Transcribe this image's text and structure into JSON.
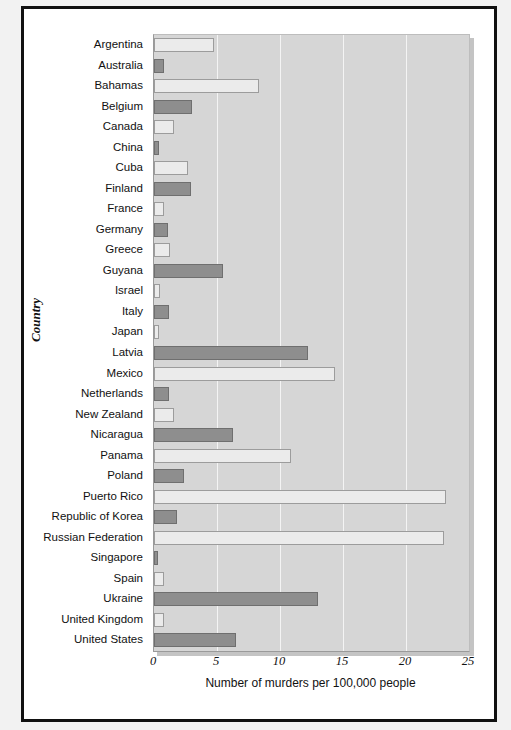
{
  "chart_data": {
    "type": "bar",
    "orientation": "horizontal",
    "title": "",
    "xlabel": "Number of murders per 100,000 people",
    "ylabel": "Country",
    "xlim": [
      0,
      25
    ],
    "xticks": [
      0,
      5,
      10,
      15,
      20,
      25
    ],
    "grid": "vertical",
    "legend": "none",
    "categories": [
      "Argentina",
      "Australia",
      "Bahamas",
      "Belgium",
      "Canada",
      "China",
      "Cuba",
      "Finland",
      "France",
      "Germany",
      "Greece",
      "Guyana",
      "Israel",
      "Italy",
      "Japan",
      "Latvia",
      "Mexico",
      "Netherlands",
      "New Zealand",
      "Nicaragua",
      "Panama",
      "Poland",
      "Puerto Rico",
      "Republic of Korea",
      "Russian Federation",
      "Singapore",
      "Spain",
      "Ukraine",
      "United Kingdom",
      "United States"
    ],
    "values": [
      4.8,
      0.8,
      8.3,
      3.0,
      1.6,
      0.4,
      2.7,
      2.9,
      0.8,
      1.1,
      1.3,
      5.5,
      0.5,
      1.2,
      0.4,
      12.2,
      14.4,
      1.2,
      1.6,
      6.3,
      10.9,
      2.4,
      23.2,
      1.8,
      23.0,
      0.3,
      0.8,
      13.0,
      0.8,
      6.5
    ],
    "bar_styles": [
      "light",
      "dark",
      "light",
      "dark",
      "light",
      "dark",
      "light",
      "dark",
      "light",
      "dark",
      "light",
      "dark",
      "light",
      "dark",
      "light",
      "dark",
      "light",
      "dark",
      "light",
      "dark",
      "light",
      "dark",
      "light",
      "dark",
      "light",
      "dark",
      "light",
      "dark",
      "light",
      "dark"
    ],
    "colors": {
      "light_bar": "#ebebeb",
      "dark_bar": "#8e8e8e",
      "plot_background": "#d6d6d6",
      "gridline": "#f4f4f4",
      "bar_shadow": "#a8a8a8",
      "frame": "#111111",
      "page_background": "#ffffff"
    }
  }
}
